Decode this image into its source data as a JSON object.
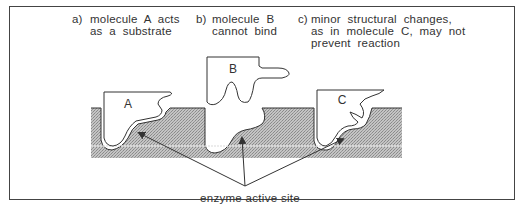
{
  "figure": {
    "captions": [
      {
        "marker": "a)",
        "line1": "molecule  A  acts",
        "line2": "as  a  substrate",
        "line3": ""
      },
      {
        "marker": "b)",
        "line1": "molecule  B",
        "line2": "cannot  bind",
        "line3": ""
      },
      {
        "marker": "c)",
        "line1": "minor  structural  changes,",
        "line2": "as  in  molecule  C,  may  not",
        "line3": "prevent  reaction"
      }
    ],
    "molecules": [
      {
        "id": "A",
        "label": "A"
      },
      {
        "id": "B",
        "label": "B"
      },
      {
        "id": "C",
        "label": "C"
      }
    ],
    "pointer_label": "enzyme  active  site",
    "colors": {
      "border": "#444444",
      "text": "#333333",
      "enzyme_fill": "#b8b8b8",
      "molecule_fill": "#ffffff"
    }
  }
}
